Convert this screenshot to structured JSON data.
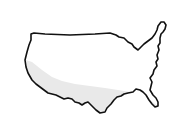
{
  "image": {
    "subject": "United States outline",
    "colors": {
      "background": "#ffffff",
      "outline": "#111111",
      "fill": "#ffffff",
      "shade": "#e9e9e9"
    }
  }
}
